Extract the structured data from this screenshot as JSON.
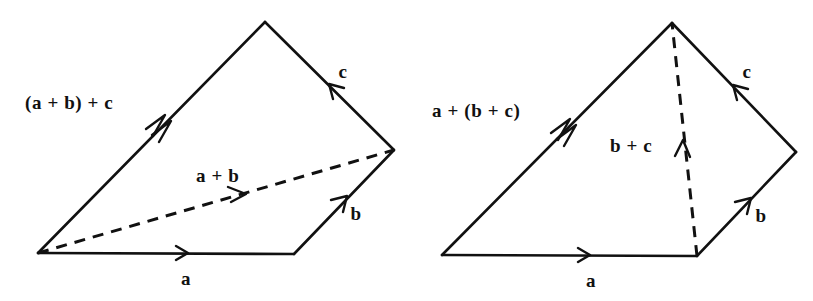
{
  "figure": {
    "background_color": "#ffffff",
    "ink_color": "#111111",
    "diagrams": [
      {
        "id": "left",
        "caption": "(a + b) + c grouping",
        "labels": {
          "resultant": "(a + b) + c",
          "partial": "a + b",
          "vector_a": "a",
          "vector_b": "b",
          "vector_c": "c"
        }
      },
      {
        "id": "right",
        "caption": "a + (b + c) grouping",
        "labels": {
          "resultant": "a + (b + c)",
          "partial": "b + c",
          "vector_a": "a",
          "vector_b": "b",
          "vector_c": "c"
        }
      }
    ]
  },
  "left_diagram": {
    "resultant_label": "(a + b) + c",
    "partial_label": "a + b",
    "a_label": "a",
    "b_label": "b",
    "c_label": "c"
  },
  "right_diagram": {
    "resultant_label": "a + (b + c)",
    "partial_label": "b + c",
    "a_label": "a",
    "b_label": "b",
    "c_label": "c"
  }
}
